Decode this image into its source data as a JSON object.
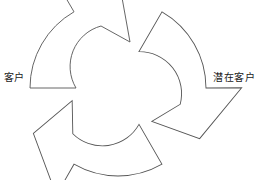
{
  "diagram": {
    "type": "cyclic-process",
    "title": "",
    "background_color": "#ffffff",
    "stroke_color": "#555555",
    "fill_color": "#ffffff",
    "stroke_width": 0.9,
    "arrow_count": 3,
    "rotation_direction": "counter-clockwise",
    "center": {
      "x": 118,
      "y": 88
    },
    "labels": [
      {
        "id": "customer",
        "text": "客户",
        "position": "left"
      },
      {
        "id": "prospect",
        "text": "潜在客户",
        "position": "right"
      }
    ],
    "arrows": [
      {
        "id": "arrow-top",
        "name": "top-left-pointing-arrow",
        "rotation_deg": 0
      },
      {
        "id": "arrow-bottom-right",
        "name": "bottom-right-pointing-arrow",
        "rotation_deg": 120
      },
      {
        "id": "arrow-bottom-left",
        "name": "bottom-left-pointing-arrow",
        "rotation_deg": 240
      }
    ]
  }
}
